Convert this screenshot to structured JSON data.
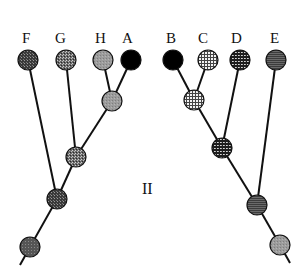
{
  "figure": {
    "panel_label": "II"
  },
  "left_tree": {
    "leaves": [
      {
        "id": "F",
        "label": "F",
        "x": 28,
        "y": 60,
        "fill": "pat-dark-stipple"
      },
      {
        "id": "G",
        "label": "G",
        "x": 66,
        "y": 60,
        "fill": "pat-mid-stipple"
      },
      {
        "id": "H",
        "label": "H",
        "x": 103,
        "y": 60,
        "fill": "pat-light-gray"
      },
      {
        "id": "A",
        "label": "A",
        "x": 131,
        "y": 60,
        "fill": "#000000"
      }
    ],
    "internal": [
      {
        "id": "HA",
        "x": 112,
        "y": 101,
        "fill": "pat-light-gray"
      },
      {
        "id": "GHA",
        "x": 76,
        "y": 157,
        "fill": "pat-mid-stipple"
      },
      {
        "id": "FGHA",
        "x": 57,
        "y": 199,
        "fill": "pat-dark-stipple"
      },
      {
        "id": "rootL",
        "x": 30,
        "y": 247,
        "fill": "pat-dark-gray"
      }
    ]
  },
  "right_tree": {
    "leaves": [
      {
        "id": "B",
        "label": "B",
        "x": 173,
        "y": 60,
        "fill": "#000000"
      },
      {
        "id": "C",
        "label": "C",
        "x": 208,
        "y": 60,
        "fill": "pat-light-grid"
      },
      {
        "id": "D",
        "label": "D",
        "x": 240,
        "y": 60,
        "fill": "pat-dark-grid"
      },
      {
        "id": "E",
        "label": "E",
        "x": 276,
        "y": 60,
        "fill": "pat-horiz-lines"
      }
    ],
    "internal": [
      {
        "id": "BC",
        "x": 194,
        "y": 100,
        "fill": "pat-light-grid"
      },
      {
        "id": "BCD",
        "x": 222,
        "y": 148,
        "fill": "pat-dark-grid"
      },
      {
        "id": "BCDE",
        "x": 257,
        "y": 205,
        "fill": "pat-horiz-lines"
      },
      {
        "id": "rootR",
        "x": 280,
        "y": 245,
        "fill": "pat-light-gray"
      }
    ]
  },
  "labels": {
    "F": "F",
    "G": "G",
    "H": "H",
    "A": "A",
    "B": "B",
    "C": "C",
    "D": "D",
    "E": "E",
    "panel": "II"
  }
}
